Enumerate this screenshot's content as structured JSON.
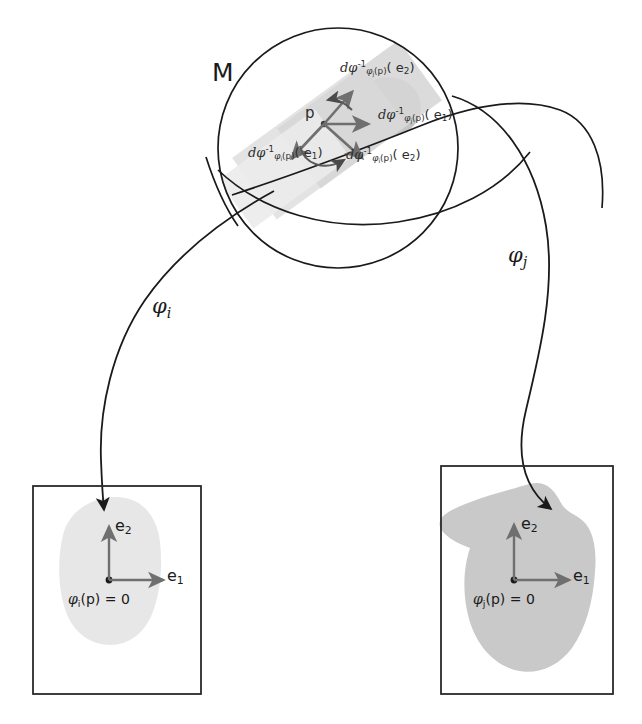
{
  "figure": {
    "manifold_label": "M",
    "point_label": "p",
    "colors": {
      "stroke": "#1a1a1a",
      "patch_light": "#e4e4e4",
      "patch_mid": "#d2d2d2",
      "patch_dark": "#bdbdbd",
      "blob_left": "#e6e6e6",
      "blob_right": "#c9c9c9",
      "arrow_gray": "#7d7d7d",
      "tangent_arrow": "#555555",
      "box_border": "#2a2a2a",
      "background": "#ffffff"
    }
  },
  "maps": {
    "phi_i": {
      "name": "phi-i",
      "base": "φ",
      "sub": "i"
    },
    "phi_j": {
      "name": "phi-j",
      "base": "φ",
      "sub": "j"
    }
  },
  "tangent_vectors": [
    {
      "id": "dphi-j-e2",
      "prefix": "dφ",
      "sup": "-1",
      "subscript_base": "φ",
      "subscript_index": "j",
      "subscript_arg": "(p)",
      "arg": "( e",
      "arg_index": "2",
      "arg_close": ")",
      "full_text": "dφ⁻¹ φj(p) ( e2 )",
      "position": "upper-right"
    },
    {
      "id": "dphi-j-e1",
      "prefix": "dφ",
      "sup": "-1",
      "subscript_base": "φ",
      "subscript_index": "j",
      "subscript_arg": "(p)",
      "arg": "( e",
      "arg_index": "1",
      "arg_close": ")",
      "full_text": "dφ⁻¹ φj(p) ( e1 )",
      "position": "right"
    },
    {
      "id": "dphi-i-e1",
      "prefix": "dφ",
      "sup": "-1",
      "subscript_base": "φ",
      "subscript_index": "i",
      "subscript_arg": "(p)",
      "arg": "( e",
      "arg_index": "1",
      "arg_close": ")",
      "full_text": "dφ⁻¹ φi(p) ( e1 )",
      "position": "lower-left"
    },
    {
      "id": "dphi-i-e2",
      "prefix": "dφ",
      "sup": "-1",
      "subscript_base": "φ",
      "subscript_index": "i",
      "subscript_arg": "(p)",
      "arg": "( e",
      "arg_index": "2",
      "arg_close": ")",
      "full_text": "dφ⁻¹ φi(p) ( e2 )",
      "position": "lower-right"
    }
  ],
  "charts": [
    {
      "id": "chart-left",
      "map_label_base": "φ",
      "map_label_sub": "i",
      "basis_e1": "e",
      "basis_e1_sub": "1",
      "basis_e2": "e",
      "basis_e2_sub": "2",
      "origin_base": "φ",
      "origin_sub": "i",
      "origin_rest": "(p) = 0",
      "blob_style": "light-rounded"
    },
    {
      "id": "chart-right",
      "map_label_base": "φ",
      "map_label_sub": "j",
      "basis_e1": "e",
      "basis_e1_sub": "1",
      "basis_e2": "e",
      "basis_e2_sub": "2",
      "origin_base": "φ",
      "origin_sub": "j",
      "origin_rest": "(p) = 0",
      "blob_style": "dark-irregular"
    }
  ]
}
